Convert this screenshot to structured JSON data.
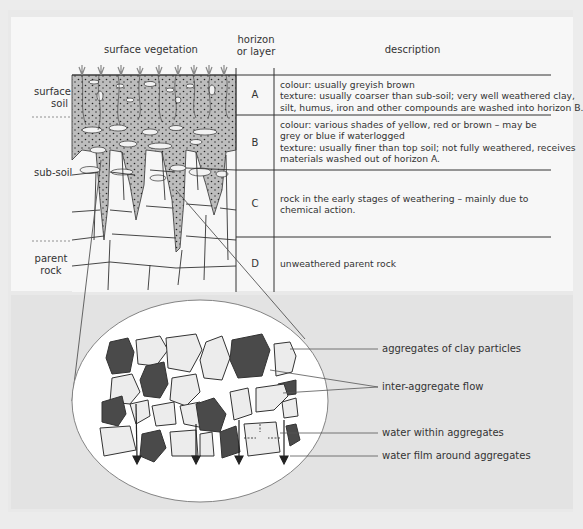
{
  "diagram": {
    "title_labels": {
      "surface_vegetation": "surface vegetation",
      "horizon_header_1": "horizon",
      "horizon_header_2": "or layer",
      "description_header": "description"
    },
    "side_labels": {
      "surface_soil_1": "surface",
      "surface_soil_2": "soil",
      "sub_soil": "sub-soil",
      "parent_rock_1": "parent",
      "parent_rock_2": "rock"
    },
    "horizons": [
      {
        "id": "A",
        "lines": [
          "colour: usually greyish brown",
          "texture: usually coarser than sub-soil; very well weathered clay,",
          "silt, humus, iron and other compounds are washed into horizon B."
        ]
      },
      {
        "id": "B",
        "lines": [
          "colour: various shades of yellow, red or brown – may be",
          "grey or blue if waterlogged",
          "texture: usually finer than top soil; not fully weathered, receives",
          "materials washed out of horizon A."
        ]
      },
      {
        "id": "C",
        "lines": [
          "rock in the early stages of weathering – mainly due to",
          "chemical action."
        ]
      },
      {
        "id": "D",
        "lines": [
          "unweathered parent rock"
        ]
      }
    ],
    "inset_labels": [
      "aggregates of clay particles",
      "inter-aggregate flow",
      "water within aggregates",
      "water film around aggregates"
    ],
    "colors": {
      "soil_fill": "#bdbdbd",
      "aggregate_dark": "#4a4a4a",
      "aggregate_light": "#ececec",
      "line": "#333333",
      "panel_bg": "#f7f7f7",
      "lower_bg": "#e3e3e3"
    }
  }
}
